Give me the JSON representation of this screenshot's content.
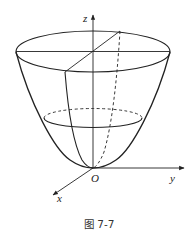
{
  "figure": {
    "caption": "图 7-7",
    "colors": {
      "line": "#222222",
      "background": "#ffffff"
    }
  },
  "axes": {
    "z_label": "z",
    "y_label": "y",
    "x_label": "x",
    "origin_label": "O"
  },
  "surface": {
    "type": "paraboloid",
    "top_section": "solid ellipse with horizontal diameter and diagonal radius",
    "middle_section": "ellipse, back half dashed",
    "generatrix_front": "solid parabola",
    "generatrix_back": "dashed parabola"
  }
}
